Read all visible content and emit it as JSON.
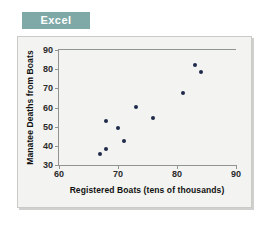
{
  "banner": {
    "label": "Excel",
    "color": "#7fa9a6"
  },
  "chart_data": {
    "type": "scatter",
    "title": "",
    "xlabel": "Registered Boats (tens of thousands)",
    "ylabel": "Manatee Deaths from Boats",
    "xlim": [
      60,
      90
    ],
    "ylim": [
      30,
      90
    ],
    "xticks": [
      60,
      70,
      80,
      90
    ],
    "yticks": [
      30,
      40,
      50,
      60,
      70,
      80,
      90
    ],
    "xtick_labels": [
      "60",
      "70",
      "80",
      "90"
    ],
    "ytick_labels": [
      "30",
      "40",
      "50",
      "60",
      "70",
      "80",
      "90"
    ],
    "grid": false,
    "legend": null,
    "marker_color": "#1f2a4a",
    "series": [
      {
        "name": "Manatee deaths vs registered boats",
        "points": [
          {
            "x": 67.0,
            "y": 35.5
          },
          {
            "x": 68.0,
            "y": 38.5
          },
          {
            "x": 67.9,
            "y": 53.0
          },
          {
            "x": 70.0,
            "y": 49.5
          },
          {
            "x": 71.1,
            "y": 42.5
          },
          {
            "x": 73.0,
            "y": 60.5
          },
          {
            "x": 76.0,
            "y": 54.5
          },
          {
            "x": 81.0,
            "y": 67.5
          },
          {
            "x": 83.0,
            "y": 82.0
          },
          {
            "x": 84.0,
            "y": 78.5
          }
        ]
      }
    ]
  }
}
